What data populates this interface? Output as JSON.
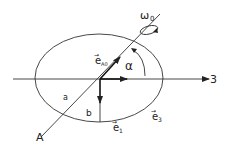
{
  "diagram": {
    "labels": {
      "omega": "ω",
      "omega_sub": "0",
      "e_A0": "e",
      "e_A0_sub": "A0",
      "alpha": "α",
      "axis_3": "3",
      "a": "a",
      "b": "b",
      "A": "A",
      "e1": "e",
      "e1_sub": "1",
      "e3": "e",
      "e3_sub": "3",
      "vec_arrow": "→"
    },
    "colors": {
      "stroke": "#222222",
      "background": "#ffffff"
    }
  }
}
